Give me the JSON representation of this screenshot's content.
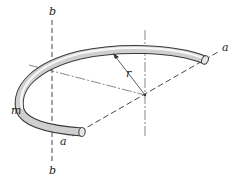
{
  "diagram": {
    "type": "curved-rod-geometry",
    "labels": {
      "axis_b_top": "b",
      "axis_b_bottom": "b",
      "axis_a_right": "a",
      "axis_a_left": "a",
      "radius": "r",
      "mass_point": "m"
    },
    "colors": {
      "line": "#333333",
      "rod_light": "#f2f2f2",
      "rod_mid": "#bdbdbd",
      "rod_dark": "#5a5a5a",
      "background": "#ffffff"
    }
  }
}
